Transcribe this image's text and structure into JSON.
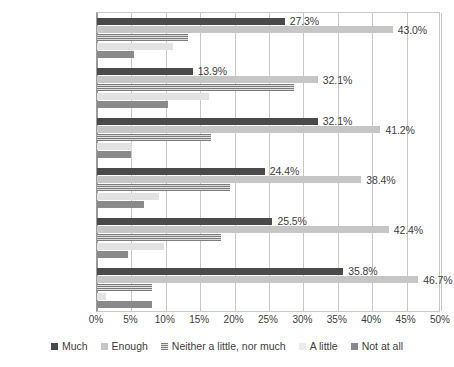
{
  "chart_data": {
    "type": "bar",
    "orientation": "horizontal",
    "title": "",
    "xlabel": "",
    "ylabel": "",
    "xlim": [
      0,
      50
    ],
    "xtick_labels": [
      "0%",
      "5%",
      "10%",
      "15%",
      "20%",
      "25%",
      "30%",
      "35%",
      "40%",
      "45%",
      "50%"
    ],
    "xtick_values": [
      0,
      5,
      10,
      15,
      20,
      25,
      30,
      35,
      40,
      45,
      50
    ],
    "grid": true,
    "legend_position": "bottom",
    "categories": [
      "Risk perception",
      "Social acceptance\nof risk",
      "Level of alert",
      "Exposure",
      "Vulnerability",
      "Hazard"
    ],
    "series": [
      {
        "name": "Much",
        "color": "#4a4a4a",
        "values": [
          27.3,
          13.9,
          32.1,
          24.4,
          25.5,
          35.8
        ],
        "labels": [
          "27.3%",
          "13.9%",
          "32.1%",
          "24.4%",
          "25.5%",
          "35.8%"
        ]
      },
      {
        "name": "Enough",
        "color": "#c6c6c6",
        "values": [
          43.0,
          32.1,
          41.2,
          38.4,
          42.4,
          46.7
        ],
        "labels": [
          "43.0%",
          "32.1%",
          "41.2%",
          "38.4%",
          "42.4%",
          "46.7%"
        ]
      },
      {
        "name": "Neither a little, nor much",
        "color": "#9d9d9d",
        "values": [
          13.2,
          28.6,
          16.6,
          19.4,
          18.0,
          8.0
        ],
        "labels": [
          "",
          "",
          "",
          "",
          "",
          ""
        ]
      },
      {
        "name": "A little",
        "color": "#e2e2e2",
        "values": [
          11.0,
          16.3,
          5.1,
          9.0,
          9.7,
          1.3
        ],
        "labels": [
          "",
          "",
          "",
          "",
          "",
          ""
        ]
      },
      {
        "name": "Not at all",
        "color": "#8a8a8a",
        "values": [
          5.4,
          10.3,
          5.0,
          6.8,
          4.5,
          8.0
        ],
        "labels": [
          "",
          "",
          "",
          "",
          "",
          ""
        ]
      }
    ]
  }
}
